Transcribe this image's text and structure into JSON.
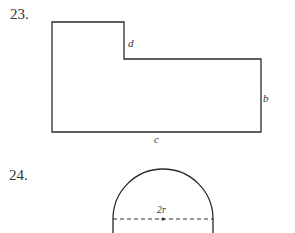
{
  "problems": [
    {
      "number": "23.",
      "figure": "L-shaped polygon",
      "labels": {
        "step_height": "d",
        "right_side": "b",
        "bottom_side": "c"
      }
    },
    {
      "number": "24.",
      "figure": "rectangle topped by semicircle",
      "labels": {
        "diameter": "2r"
      }
    }
  ],
  "colors": {
    "line": "#2a2a2a",
    "background": "#ffffff"
  }
}
